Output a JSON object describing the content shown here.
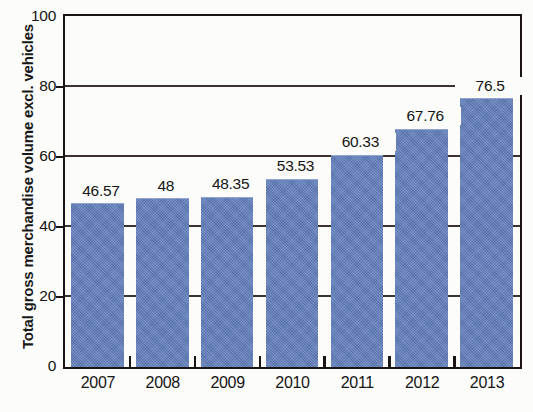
{
  "chart_data": {
    "type": "bar",
    "title": "",
    "subtitle": "",
    "xlabel": "",
    "ylabel": "Total gross merchandise volume excl. vehicles",
    "categories": [
      "2007",
      "2008",
      "2009",
      "2010",
      "2011",
      "2012",
      "2013"
    ],
    "values": [
      46.57,
      48,
      48.35,
      53.53,
      60.33,
      67.76,
      76.5
    ],
    "data_labels": [
      "46.57",
      "48",
      "48.35",
      "53.53",
      "60.33",
      "67.76",
      "76.5"
    ],
    "ylim": [
      0,
      100
    ],
    "ytick_labels": [
      "0",
      "20",
      "40",
      "60",
      "80",
      "100"
    ],
    "ytick_values": [
      0,
      20,
      40,
      60,
      80,
      100
    ],
    "grid": true,
    "grid_axis": "y",
    "legend": null,
    "legend_position": "none",
    "series": [
      {
        "name": "Total gross merchandise volume excl. vehicles",
        "values": [
          46.57,
          48,
          48.35,
          53.53,
          60.33,
          67.76,
          76.5
        ]
      }
    ],
    "colors": {
      "bar": "#6280bd",
      "bar_edge": "#8fa6d4",
      "axis": "#1a1412",
      "gridline": "#3a3330",
      "text": "#151515",
      "background": "#fcfcfa"
    }
  }
}
